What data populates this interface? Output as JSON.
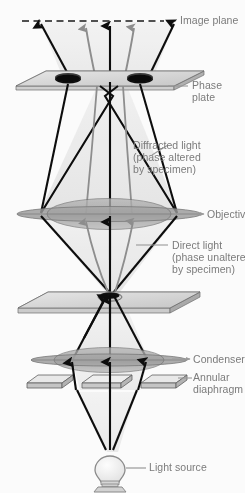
{
  "figure": {
    "background_color": "#fbfbfb",
    "label_color": "#7b7b7b"
  },
  "labels": {
    "image_plane": "Image plane",
    "phase_plate_line1": "Phase",
    "phase_plate_line2": "plate",
    "diffracted_line1": "Diffracted light",
    "diffracted_line2": "(phase altered",
    "diffracted_line3": "by specimen)",
    "objective_lens": "Objective lens",
    "direct_line1": "Direct light",
    "direct_line2": "(phase unaltered",
    "direct_line3": "by specimen)",
    "condenser_lens": "Condenser lens",
    "annular_line1": "Annular",
    "annular_line2": "diaphragm",
    "light_source": "Light source"
  },
  "components": {
    "image_plane": {
      "name": "image-plane",
      "style": "dashed-line",
      "color": "#1a1a1a"
    },
    "phase_plate": {
      "name": "phase-plate",
      "style": "3d-parallelogram-plate",
      "holes": 2,
      "hole_color": "#111111",
      "face_color": "#d2d2d2"
    },
    "objective_lens": {
      "name": "objective-lens",
      "style": "biconvex-ellipse",
      "color": "#a8a8a8"
    },
    "specimen_slide": {
      "name": "specimen-slide",
      "style": "3d-parallelogram-plate",
      "face_color": "#cfcfcf"
    },
    "condenser_lens": {
      "name": "condenser-lens",
      "style": "biconvex-ellipse",
      "color": "#a8a8a8"
    },
    "annular_diaphragm": {
      "name": "annular-diaphragm",
      "style": "three-3d-plates",
      "plates": 3,
      "face_color": "#e2e2e2"
    },
    "light_source": {
      "name": "light-source",
      "style": "light-bulb",
      "color": "#8f8f8f"
    }
  },
  "rays": {
    "direct_light": {
      "color": "#0d0d0d",
      "description": "Direct light (phase unaltered by specimen)"
    },
    "diffracted_light": {
      "color": "#8a8a8a",
      "description": "Diffracted light (phase altered by specimen)"
    },
    "beam_fill": "#dedede"
  }
}
